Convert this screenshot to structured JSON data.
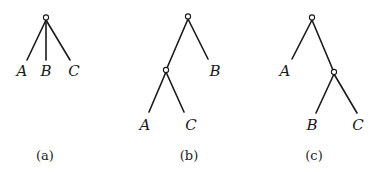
{
  "figure": {
    "panels": [
      {
        "id": "a",
        "caption": "(a)",
        "structure": "star tree: root with three leaves A, B, C",
        "leaves": [
          "A",
          "B",
          "C"
        ],
        "labels": {
          "A": "A",
          "B": "B",
          "C": "C"
        }
      },
      {
        "id": "b",
        "caption": "(b)",
        "structure": "((A,C),B)",
        "leaves": [
          "A",
          "C",
          "B"
        ],
        "labels": {
          "A": "A",
          "B": "B",
          "C": "C"
        }
      },
      {
        "id": "c",
        "caption": "(c)",
        "structure": "(A,(B,C))",
        "leaves": [
          "A",
          "B",
          "C"
        ],
        "labels": {
          "A": "A",
          "B": "B",
          "C": "C"
        }
      }
    ],
    "colors": {
      "ink": "#1a1a1a",
      "background": "#ffffff"
    }
  }
}
